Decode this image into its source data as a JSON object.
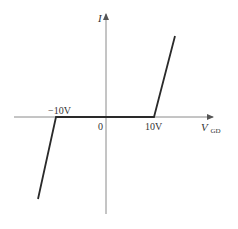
{
  "diagram": {
    "type": "I-V characteristic",
    "y_axis": {
      "label": "I"
    },
    "x_axis": {
      "label_main": "V",
      "label_sub": "GD"
    },
    "origin_label": "0",
    "tick_labels": {
      "negative": "−10V",
      "positive": "10V"
    },
    "colors": {
      "axis": "#8a8a8a",
      "curve": "#2a2a2a",
      "text": "#333333",
      "background": "#ffffff"
    }
  }
}
